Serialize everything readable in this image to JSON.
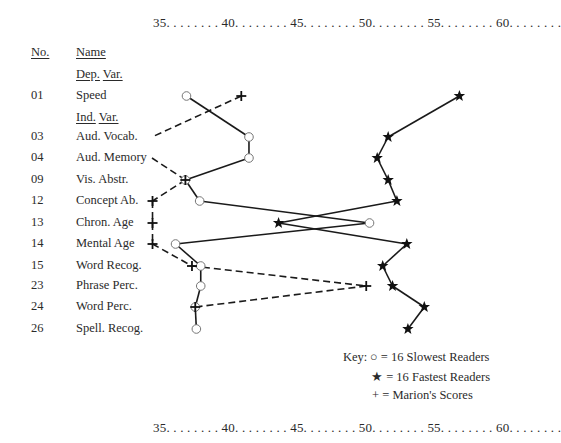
{
  "chart_data": {
    "type": "line",
    "title": "",
    "xlabel": "",
    "ylabel": "",
    "x_axis": {
      "ticks": [
        35,
        40,
        45,
        50,
        55,
        60
      ],
      "tick_labels": [
        "35",
        "40",
        "45",
        "50",
        "55",
        "60"
      ],
      "range": [
        35,
        65
      ],
      "positions": [
        "top",
        "bottom"
      ]
    },
    "header": {
      "no": "No.",
      "name": "Name"
    },
    "dep_var_label": {
      "a": "Dep.",
      "b": "Var."
    },
    "ind_var_label": {
      "a": "Ind.",
      "b": "Var."
    },
    "categories": [
      {
        "no": "01",
        "name": "Speed",
        "group": "dep"
      },
      {
        "no": "03",
        "name": "Aud. Vocab.",
        "group": "ind"
      },
      {
        "no": "04",
        "name": "Aud. Memory",
        "group": "ind"
      },
      {
        "no": "09",
        "name": "Vis. Abstr.",
        "group": "ind"
      },
      {
        "no": "12",
        "name": "Concept Ab.",
        "group": "ind"
      },
      {
        "no": "13",
        "name": "Chron. Age",
        "group": "ind"
      },
      {
        "no": "14",
        "name": "Mental Age",
        "group": "ind"
      },
      {
        "no": "15",
        "name": "Word Recog.",
        "group": "ind"
      },
      {
        "no": "23",
        "name": "Phrase Perc.",
        "group": "ind"
      },
      {
        "no": "24",
        "name": "Word Perc.",
        "group": "ind"
      },
      {
        "no": "26",
        "name": "Spell. Recog.",
        "group": "ind"
      }
    ],
    "series": [
      {
        "name": "16 Slowest Readers",
        "marker": "circle",
        "line": "solid",
        "values": [
          37.6,
          43.3,
          43.3,
          37.5,
          38.8,
          54.3,
          36.6,
          38.9,
          38.9,
          38.4,
          38.5
        ]
      },
      {
        "name": "16 Fastest Readers",
        "marker": "star",
        "line": "solid",
        "values": [
          62.5,
          56.0,
          55.0,
          56.0,
          56.8,
          46.0,
          57.7,
          55.5,
          56.4,
          59.3,
          57.8
        ]
      },
      {
        "name": "Marion's Scores",
        "marker": "plus",
        "line": "dashed",
        "values": [
          42.6,
          "below 35",
          "below 35",
          37.5,
          34.5,
          34.5,
          34.5,
          38.1,
          54.0,
          38.4,
          null
        ]
      }
    ],
    "legend": {
      "title": "Key:",
      "placement": "bottom-right",
      "items": [
        {
          "symbol": "○",
          "eq": "=",
          "label": "16 Slowest Readers"
        },
        {
          "symbol": "★",
          "eq": "=",
          "label": "16 Fastest Readers"
        },
        {
          "symbol": "+",
          "eq": "=",
          "label": "Marion's Scores"
        }
      ]
    },
    "grid": false
  },
  "axis_text": {
    "top": "35. . . . . . . . 40. . . . . . . . 45. . . . . . . . 50. . . . . . . . 55. . . . . . . . 60. . . . . . . .",
    "bottom": "35. . . . . . . . 40. . . . . . . . 45. . . . . . . . 50. . . . . . . . 55. . . . . . . . 60. . . . . . . ."
  }
}
